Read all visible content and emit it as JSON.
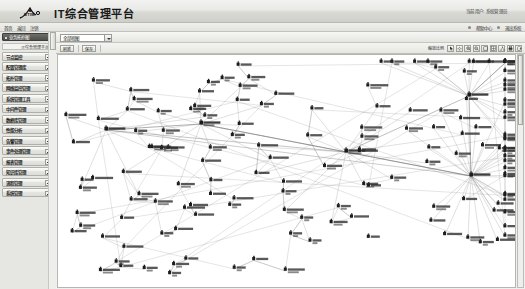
{
  "header": {
    "logo_text": "BTIM",
    "title": "IT综合管理平台",
    "user_info": "当前用户:  系统管理员"
  },
  "navbar": {
    "links": [
      "首页",
      "返回",
      "注销"
    ],
    "right_links": [
      "帮助中心",
      "退出系统"
    ]
  },
  "sidebar": {
    "panel_title": "业务拓扑图",
    "panel_subtitle": "IT综合管理平台",
    "items": [
      {
        "label": "节点监控",
        "expander": "plus"
      },
      {
        "label": "配置管理库",
        "expander": "plus"
      },
      {
        "label": "拓扑管理",
        "expander": "plus"
      },
      {
        "label": "网络监控管理",
        "expander": "plus"
      },
      {
        "label": "系统管理工具",
        "expander": "plus"
      },
      {
        "label": "中间件管理",
        "expander": "plus"
      },
      {
        "label": "数据库管理",
        "expander": "plus"
      },
      {
        "label": "性能分析",
        "expander": "plus"
      },
      {
        "label": "告警管理",
        "expander": "plus"
      },
      {
        "label": "事件处理管理",
        "expander": "plus"
      },
      {
        "label": "报表管理",
        "expander": "plus"
      },
      {
        "label": "知识库管理",
        "expander": "plus"
      },
      {
        "label": "流程管理",
        "expander": "plus"
      },
      {
        "label": "系统管理",
        "expander": "plus"
      }
    ]
  },
  "toolbar": {
    "view_select_value": "全部视图",
    "buttons": [
      "刷新",
      "保存"
    ],
    "zoom_label": "缩放比例",
    "icons": [
      "pointer-icon",
      "pan-icon",
      "zoom-in-icon",
      "zoom-out-icon",
      "fit-icon",
      "grid-icon",
      "layout-icon",
      "print-icon",
      "export-icon"
    ]
  },
  "chart_data": {
    "type": "diagram",
    "title": "业务拓扑图",
    "hubs": [
      {
        "id": "hub_right_top",
        "x": 468,
        "y": 96,
        "degree": 22
      },
      {
        "id": "hub_right_bottom",
        "x": 470,
        "y": 176,
        "degree": 34
      },
      {
        "id": "hub_center",
        "x": 345,
        "y": 152,
        "degree": 12
      },
      {
        "id": "hub_mid_left",
        "x": 200,
        "y": 124,
        "degree": 10
      },
      {
        "id": "hub_left",
        "x": 105,
        "y": 130,
        "degree": 7
      }
    ],
    "node_count": 168,
    "edge_count": 210
  }
}
